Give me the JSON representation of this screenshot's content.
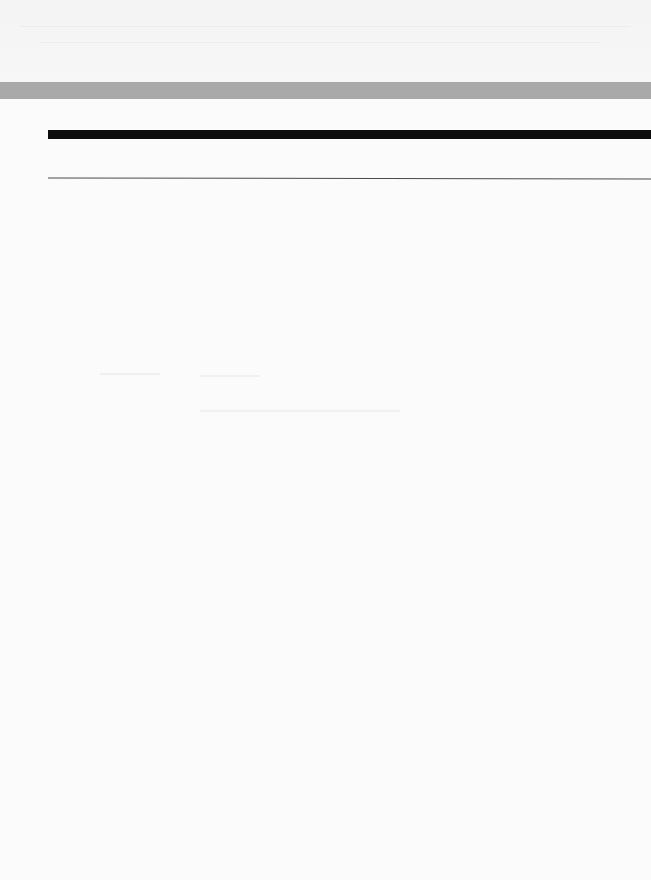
{
  "page": {
    "background_color": "#fbfbfb",
    "header": {
      "band_text": "",
      "bar_color": "#a9a9a9"
    },
    "rules": [
      {
        "type": "thick",
        "color": "#0d0d0d"
      },
      {
        "type": "thin",
        "color": "#4a4a4a"
      }
    ],
    "body_text": ""
  }
}
